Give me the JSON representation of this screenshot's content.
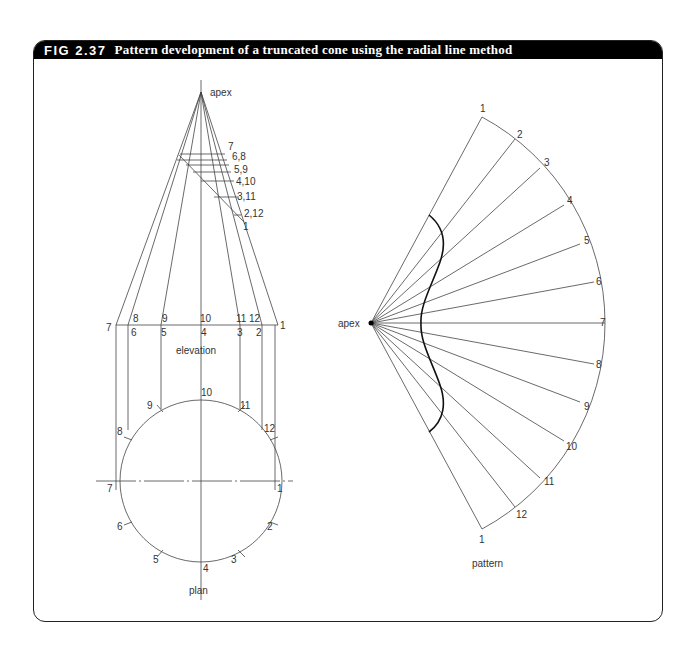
{
  "figure": {
    "number": "FIG 2.37",
    "title": "Pattern development of a truncated cone using the radial line method"
  },
  "elevation": {
    "label": "elevation",
    "apex_label": "apex",
    "cut_labels": [
      "7",
      "6,8",
      "5,9",
      "4,10",
      "3,11",
      "2,12",
      "1"
    ],
    "base_top_labels": [
      "8",
      "9",
      "10",
      "11",
      "12"
    ],
    "base_bottom_labels": [
      "7",
      "6",
      "5",
      "4",
      "3",
      "2",
      "1"
    ]
  },
  "plan": {
    "label": "plan",
    "points": [
      "1",
      "2",
      "3",
      "4",
      "5",
      "6",
      "7",
      "8",
      "9",
      "10",
      "11",
      "12"
    ]
  },
  "pattern": {
    "label": "pattern",
    "apex_label": "apex",
    "points": [
      "1",
      "2",
      "3",
      "4",
      "5",
      "6",
      "7",
      "8",
      "9",
      "10",
      "11",
      "12",
      "1"
    ]
  },
  "colors": {
    "line": "#444444",
    "curve": "#111111",
    "header_bg": "#000000",
    "header_text": "#ffffff"
  }
}
